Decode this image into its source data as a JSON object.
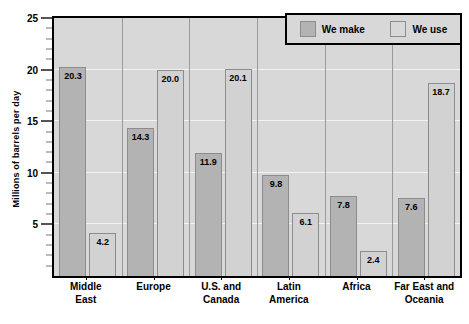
{
  "chart_data": {
    "type": "bar",
    "title": "",
    "xlabel": "",
    "ylabel": "Millions of barrels per day",
    "ylim": [
      0,
      25
    ],
    "ytick_labels": [
      "5",
      "10",
      "15",
      "20",
      "25"
    ],
    "ytick_values": [
      5,
      10,
      15,
      20,
      25
    ],
    "minor_tick_step": 1,
    "grid": true,
    "legend_position": "top-right",
    "categories": [
      "Middle East",
      "Europe",
      "U.S. and Canada",
      "Latin America",
      "Africa",
      "Far East and Oceania"
    ],
    "category_lines": [
      [
        "Middle",
        "East"
      ],
      [
        "Europe"
      ],
      [
        "U.S. and",
        "Canada"
      ],
      [
        "Latin",
        "America"
      ],
      [
        "Africa"
      ],
      [
        "Far East and",
        "Oceania"
      ]
    ],
    "series": [
      {
        "name": "We make",
        "color": "#b3b3b3",
        "values": [
          20.3,
          14.3,
          11.9,
          9.8,
          7.8,
          7.6
        ],
        "labels": [
          "20.3",
          "14.3",
          "11.9",
          "9.8",
          "7.8",
          "7.6"
        ]
      },
      {
        "name": "We use",
        "color": "#d2d2d2",
        "values": [
          4.2,
          20.0,
          20.1,
          6.1,
          2.4,
          18.7
        ],
        "labels": [
          "4.2",
          "20.0",
          "20.1",
          "6.1",
          "2.4",
          "18.7"
        ]
      }
    ]
  },
  "legend": {
    "items": [
      {
        "label": "We make",
        "swatch": "make"
      },
      {
        "label": "We use",
        "swatch": "use"
      }
    ]
  },
  "colors": {
    "plot_background": "#d8d8d8",
    "gridline": "#f2f2f2",
    "frame": "#000000",
    "bar_make": "#b3b3b3",
    "bar_use": "#d2d2d2",
    "bar_border": "#8c8c8c",
    "text": "#000000"
  }
}
